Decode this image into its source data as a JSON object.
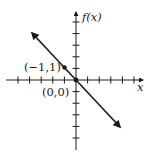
{
  "chart_data": {
    "type": "line",
    "title": "",
    "xlabel": "x",
    "ylabel": "f(x)",
    "function": "f(x) = -x",
    "xlim": [
      -6,
      6
    ],
    "ylim": [
      -6,
      6
    ],
    "x_ticks": [
      -5,
      -4,
      -3,
      -2,
      -1,
      1,
      2,
      3,
      4,
      5
    ],
    "y_ticks": [
      -5,
      -4,
      -3,
      -2,
      -1,
      1,
      2,
      3,
      4,
      5
    ],
    "tick_labels_shown": false,
    "grid": false,
    "legend": null,
    "series": [
      {
        "name": "f(x) = -x",
        "x": [
          -3.8,
          3.8
        ],
        "y": [
          3.8,
          -3.8
        ],
        "arrows_both_ends": true,
        "color": "#1a1a1a"
      }
    ],
    "points": [
      {
        "label": "(−1,1)",
        "x": -1,
        "y": 1
      },
      {
        "label": "(0,0)",
        "x": 0,
        "y": 0
      }
    ],
    "annotations": [
      "(−1,1)",
      "(0,0)"
    ],
    "colors": {
      "ink": "#1a1a1a",
      "background": "#ffffff"
    }
  },
  "labels": {
    "y_axis": "f(x)",
    "x_axis": "x",
    "point_a": "(−1,1)",
    "point_origin": "(0,0)"
  }
}
